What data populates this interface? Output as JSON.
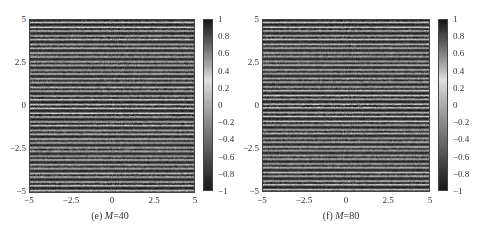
{
  "chart_data": [
    {
      "type": "heatmap",
      "title": "",
      "caption_label": "(e)",
      "caption_var": "M",
      "caption_value": "=40",
      "caption": "(e) M=40",
      "xlabel": "",
      "ylabel": "",
      "xlim": [
        -5,
        5
      ],
      "ylim": [
        -5,
        5
      ],
      "x_ticks": [
        "-5",
        "-2.5",
        "0",
        "2.5",
        "5"
      ],
      "y_ticks": [
        "5",
        "2.5",
        "0",
        "-2.5",
        "-5"
      ],
      "colorbar": {
        "range": [
          -1,
          1
        ],
        "ticks": [
          "1",
          "0.8",
          "0.6",
          "0.4",
          "0.2",
          "0",
          "-0.2",
          "-0.4",
          "-0.6",
          "-0.8",
          "-1"
        ],
        "colormap": "gray-diverging (dark at ±1, light near 0.2–0.4)"
      },
      "pattern": "horizontal stripes, ~20 periods over y in [-5, 5], uniform along x",
      "stripe_count": 20,
      "grid": false
    },
    {
      "type": "heatmap",
      "title": "",
      "caption_label": "(f)",
      "caption_var": "M",
      "caption_value": "=80",
      "caption": "(f) M=80",
      "xlabel": "",
      "ylabel": "",
      "xlim": [
        -5,
        5
      ],
      "ylim": [
        -5,
        5
      ],
      "x_ticks": [
        "-5",
        "-2.5",
        "0",
        "2.5",
        "5"
      ],
      "y_ticks": [
        "5",
        "2.5",
        "0",
        "-2.5",
        "-5"
      ],
      "colorbar": {
        "range": [
          -1,
          1
        ],
        "ticks": [
          "1",
          "0.8",
          "0.6",
          "0.4",
          "0.2",
          "0",
          "-0.2",
          "-0.4",
          "-0.6",
          "-0.8",
          "-1"
        ],
        "colormap": "gray-diverging (dark at ±1, light near 0.2–0.4)"
      },
      "pattern": "horizontal stripes, ~20 periods over y in [-5, 5], uniform along x",
      "stripe_count": 20,
      "grid": false
    }
  ],
  "colors": {
    "dark": "#1a1a1a",
    "mid": "#5a5a5a",
    "light": "#c8c8c8",
    "axis": "#444444"
  }
}
